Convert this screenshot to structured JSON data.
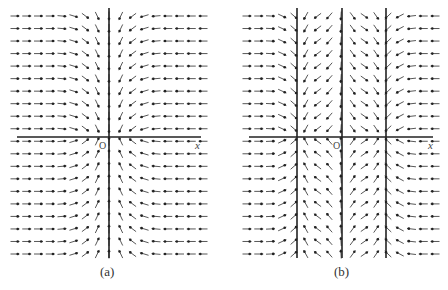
{
  "figure": {
    "panels": [
      {
        "id": "a",
        "caption": "(a)",
        "origin_label": "O",
        "axis_label": "x",
        "box": {
          "x0": 15,
          "x1": 203,
          "y0": 16,
          "y1": 254
        },
        "axis_y": 137,
        "vertical_lines_x": [
          109
        ],
        "field": "converge_center"
      },
      {
        "id": "b",
        "caption": "(b)",
        "origin_label": "O",
        "axis_label": "x",
        "box": {
          "x0": 247,
          "x1": 435,
          "y0": 16,
          "y1": 254
        },
        "axis_y": 137,
        "vertical_lines_x": [
          297,
          342,
          386
        ],
        "field": "two_attractors"
      }
    ]
  },
  "chart_data": {
    "type": "vector_field",
    "panels": [
      {
        "label": "(a)",
        "description": "Direction field converging toward the vertical axis; arrows point toward x=0 and toward y=0",
        "grid_cols": 17,
        "grid_rows": 20,
        "axis_labels": {
          "x": "x",
          "origin": "O"
        }
      },
      {
        "label": "(b)",
        "description": "Direction field with three vertical lines; arrows converge toward the two outer lines and diverge from the central line",
        "grid_cols": 17,
        "grid_rows": 20,
        "axis_labels": {
          "x": "x",
          "origin": "O"
        }
      }
    ]
  }
}
